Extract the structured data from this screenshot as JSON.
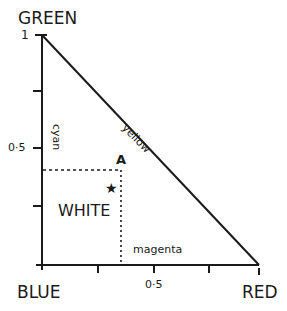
{
  "diagram": {
    "type": "chromaticity-triangle",
    "colors": {
      "ink": "#1a1a1a",
      "background": "#ffffff"
    },
    "corners": {
      "top": "GREEN",
      "bottom_left": "BLUE",
      "bottom_right": "RED"
    },
    "edges": {
      "hypotenuse": "yellow",
      "left": "cyan",
      "bottom": "magenta"
    },
    "y_axis": {
      "tick_labels": [
        "1",
        "0·5"
      ]
    },
    "x_axis": {
      "tick_labels": [
        "0·5"
      ]
    },
    "point": {
      "label": "A",
      "x": 0.36,
      "y": 0.41
    },
    "white_point": {
      "label": "WHITE",
      "symbol": "★",
      "x": 0.33,
      "y": 0.33
    }
  }
}
